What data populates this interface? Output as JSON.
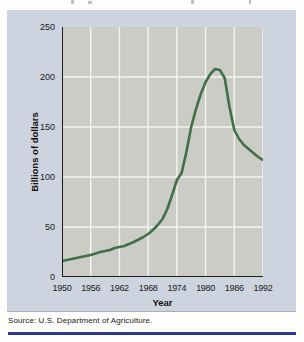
{
  "page": {
    "source_note": "Source: U.S. Department of Agriculture."
  },
  "colors": {
    "panel_bg": "#cdd3df",
    "plot_bg": "#cbccc6",
    "grid": "#f5f5f0",
    "line": "#3f7046",
    "axis": "#1c1c1c",
    "bottom_rule": "#2b3990",
    "text": "#1a1a1a"
  },
  "chart_data": {
    "type": "line",
    "title": "",
    "xlabel": "Year",
    "ylabel": "Billions of dollars",
    "xlim": [
      1950,
      1992
    ],
    "ylim": [
      0,
      250
    ],
    "x_ticks": [
      1950,
      1956,
      1962,
      1968,
      1974,
      1980,
      1986,
      1992
    ],
    "y_ticks": [
      0,
      50,
      100,
      150,
      200,
      250
    ],
    "x_gridlines": [
      1956,
      1962,
      1968,
      1974,
      1980,
      1986,
      1992
    ],
    "y_gridlines": [
      50,
      100,
      150,
      200
    ],
    "grid": true,
    "legend": "none",
    "points": [
      [
        1950,
        16
      ],
      [
        1952,
        18
      ],
      [
        1954,
        20
      ],
      [
        1956,
        22
      ],
      [
        1958,
        25
      ],
      [
        1960,
        27
      ],
      [
        1961,
        29
      ],
      [
        1963,
        31
      ],
      [
        1965,
        35
      ],
      [
        1967,
        40
      ],
      [
        1968,
        43
      ],
      [
        1969,
        47
      ],
      [
        1970,
        52
      ],
      [
        1971,
        58
      ],
      [
        1972,
        68
      ],
      [
        1973,
        82
      ],
      [
        1974,
        97
      ],
      [
        1975,
        104
      ],
      [
        1976,
        125
      ],
      [
        1977,
        150
      ],
      [
        1978,
        168
      ],
      [
        1979,
        183
      ],
      [
        1980,
        195
      ],
      [
        1981,
        203
      ],
      [
        1982,
        208
      ],
      [
        1983,
        207
      ],
      [
        1984,
        199
      ],
      [
        1985,
        170
      ],
      [
        1986,
        147
      ],
      [
        1987,
        138
      ],
      [
        1988,
        132
      ],
      [
        1989,
        128
      ],
      [
        1990,
        124
      ],
      [
        1991,
        120
      ],
      [
        1992,
        117
      ]
    ]
  }
}
